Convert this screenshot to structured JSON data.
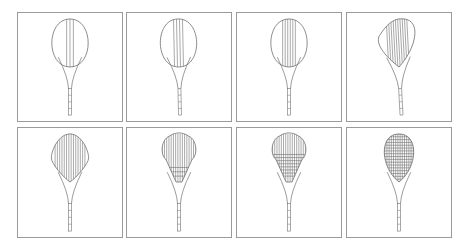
{
  "figure": {
    "stroke_color": "#6e6e6e",
    "border_color": "#9a9a9a",
    "panels": [
      {
        "id": 1,
        "x": 17,
        "y": 12,
        "w": 106,
        "h": 110,
        "head": "oval",
        "tilt": 0,
        "mains": 3,
        "main_span": 0.18,
        "crosses": 0,
        "cross_span": 0
      },
      {
        "id": 2,
        "x": 126,
        "y": 12,
        "w": 106,
        "h": 110,
        "head": "oval",
        "tilt": 4,
        "mains": 4,
        "main_span": 0.24,
        "crosses": 0,
        "cross_span": 0
      },
      {
        "id": 3,
        "x": 236,
        "y": 12,
        "w": 106,
        "h": 110,
        "head": "oval",
        "tilt": 0,
        "mains": 6,
        "main_span": 0.34,
        "crosses": 0,
        "cross_span": 0
      },
      {
        "id": 4,
        "x": 346,
        "y": 12,
        "w": 106,
        "h": 110,
        "head": "skewed",
        "tilt": 10,
        "mains": 10,
        "main_span": 0.55,
        "crosses": 0,
        "cross_span": 0
      },
      {
        "id": 5,
        "x": 17,
        "y": 127,
        "w": 106,
        "h": 111,
        "head": "diamond",
        "tilt": 0,
        "mains": 14,
        "main_span": 0.8,
        "crosses": 0,
        "cross_span": 0
      },
      {
        "id": 6,
        "x": 126,
        "y": 127,
        "w": 106,
        "h": 111,
        "head": "flared",
        "tilt": 0,
        "mains": 16,
        "main_span": 0.9,
        "crosses": 3,
        "cross_span": 0.18
      },
      {
        "id": 7,
        "x": 236,
        "y": 127,
        "w": 106,
        "h": 111,
        "head": "fan",
        "tilt": 0,
        "mains": 18,
        "main_span": 1.0,
        "crosses": 8,
        "cross_span": 0.45
      },
      {
        "id": 8,
        "x": 346,
        "y": 127,
        "w": 106,
        "h": 111,
        "head": "egg",
        "tilt": 0,
        "mains": 18,
        "main_span": 1.0,
        "crosses": 18,
        "cross_span": 1.0
      }
    ]
  }
}
